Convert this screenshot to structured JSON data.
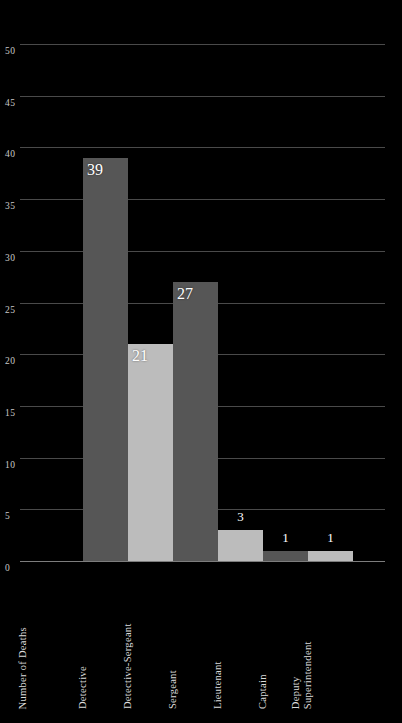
{
  "chart_data": {
    "type": "bar",
    "title": "",
    "xlabel": "",
    "ylabel": "Number of Deaths",
    "ylim": [
      0,
      50
    ],
    "grid": true,
    "legend": "none",
    "categories": [
      "Detective",
      "Detective-Sergeant",
      "Sergeant",
      "Lieutenant",
      "Captain",
      "Deputy Superintendent"
    ],
    "values": [
      39,
      21,
      27,
      3,
      1,
      1
    ],
    "value_labels": [
      "39",
      "21",
      "27",
      "3",
      "1",
      "1"
    ],
    "bar_colors": [
      "#565656",
      "#bcbcbc",
      "#565656",
      "#bcbcbc",
      "#565656",
      "#bcbcbc"
    ],
    "ytick_labels": [
      "0",
      "5",
      "10",
      "15",
      "20",
      "25",
      "30",
      "35",
      "40",
      "45",
      "50"
    ],
    "ytick_values": [
      0,
      5,
      10,
      15,
      20,
      25,
      30,
      35,
      40,
      45,
      50
    ]
  },
  "category_label_lines": [
    [
      "Detective"
    ],
    [
      "Detective-Sergeant"
    ],
    [
      "Sergeant"
    ],
    [
      "Lieutenant"
    ],
    [
      "Captain"
    ],
    [
      "Deputy",
      "Superintendent"
    ]
  ],
  "colors": {
    "background": "#000000",
    "gridline": "#4a4a4a",
    "axis": "#7d7d7d",
    "tick_text": "#c9c9c9",
    "label_text": "#dcdcdc",
    "value_text": "#ffffff",
    "bar_dark": "#565656",
    "bar_light": "#bcbcbc"
  }
}
